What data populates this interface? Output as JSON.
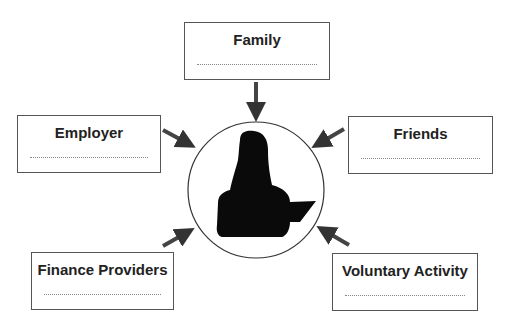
{
  "diagram": {
    "center": {
      "label": "person-silhouette"
    },
    "boxes": [
      {
        "id": "family",
        "title": "Family",
        "blank": ""
      },
      {
        "id": "employer",
        "title": "Employer",
        "blank": ""
      },
      {
        "id": "friends",
        "title": "Friends",
        "blank": ""
      },
      {
        "id": "finance",
        "title": "Finance Providers",
        "blank": ""
      },
      {
        "id": "voluntary",
        "title": "Voluntary Activity",
        "blank": ""
      }
    ],
    "colors": {
      "border": "#555555",
      "arrow": "#444444",
      "silhouette": "#0a0a0a"
    }
  }
}
